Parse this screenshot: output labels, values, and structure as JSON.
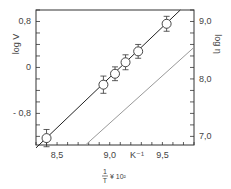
{
  "chart_data": {
    "type": "scatter",
    "title": "",
    "xlabel": "1/T × 10²",
    "xlabel_parts": {
      "numerator": "1",
      "denominator": "T",
      "suffix": "¥ 10²"
    },
    "x_unit_label": "K⁻¹",
    "ylabel_left": "log V",
    "ylabel_right": "log η",
    "xlim": [
      8.3,
      9.8
    ],
    "ylim_left": [
      -1.35,
      1.0
    ],
    "ylim_right": [
      6.85,
      9.2
    ],
    "x_ticks": [
      {
        "value": 8.5,
        "label": "8,5"
      },
      {
        "value": 9.0,
        "label": "9,0"
      },
      {
        "value": 9.5,
        "label": "9,5"
      }
    ],
    "y_left_ticks": [
      {
        "value": 0.8,
        "label": "0,8"
      },
      {
        "value": 0.0,
        "label": "0"
      },
      {
        "value": -0.8,
        "label": "- 0,8"
      }
    ],
    "y_right_ticks": [
      {
        "value": 9.0,
        "label": "9,0"
      },
      {
        "value": 8.0,
        "label": "8,0"
      },
      {
        "value": 7.0,
        "label": "7,0"
      }
    ],
    "grid": false,
    "series": [
      {
        "name": "log V (measured)",
        "style": "open-circle-with-errorbars",
        "points": [
          {
            "x": 8.4,
            "y": -1.23,
            "err": 0.15
          },
          {
            "x": 8.94,
            "y": -0.3,
            "err": 0.15
          },
          {
            "x": 9.05,
            "y": -0.11,
            "err": 0.12
          },
          {
            "x": 9.15,
            "y": 0.09,
            "err": 0.13
          },
          {
            "x": 9.27,
            "y": 0.28,
            "err": 0.12
          },
          {
            "x": 9.54,
            "y": 0.76,
            "err": 0.13
          }
        ]
      },
      {
        "name": "log V fit",
        "style": "solid-dark-line",
        "points": [
          {
            "x": 8.3,
            "y": -1.4
          },
          {
            "x": 9.67,
            "y": 1.0
          }
        ]
      },
      {
        "name": "log η",
        "style": "solid-gray-line",
        "axis": "right",
        "points": [
          {
            "x": 8.77,
            "y": 6.85
          },
          {
            "x": 9.8,
            "y": 8.55
          }
        ]
      }
    ]
  }
}
